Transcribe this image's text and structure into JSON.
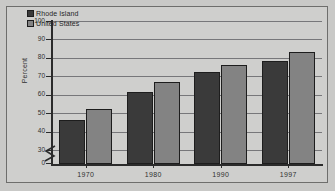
{
  "figure": {
    "top_caption_fragment": "",
    "background_color": "#cfcfcd",
    "frame_color": "#6e6e6c"
  },
  "legend": {
    "position": "top-left-inside",
    "entries": [
      {
        "label": "Rhode Island",
        "color": "#3a3a3a",
        "swatch_name": "legend-swatch-rhode-island"
      },
      {
        "label": "United States",
        "color": "#838383",
        "swatch_name": "legend-swatch-united-states"
      }
    ]
  },
  "axes": {
    "y_title": "Percent",
    "y_ticks": [
      "100",
      "90",
      "80",
      "70",
      "60",
      "50",
      "40",
      "30",
      "0"
    ],
    "y_break": true,
    "x_ticks": [
      "1970",
      "1980",
      "1990",
      "1997"
    ]
  },
  "chart_data": {
    "type": "bar",
    "title": "",
    "subtitle": "",
    "xlabel": "",
    "ylabel": "Percent",
    "categories": [
      "1970",
      "1980",
      "1990",
      "1997"
    ],
    "series": [
      {
        "name": "Rhode Island",
        "color": "#3a3a3a",
        "values": [
          46.5,
          61.5,
          72.5,
          78.5
        ]
      },
      {
        "name": "United States",
        "color": "#838383",
        "values": [
          52.5,
          67.0,
          76.0,
          83.0
        ]
      }
    ],
    "ylim": [
      30,
      100
    ],
    "y_axis_break_below": 30,
    "y_tick_step": 10,
    "grid": true,
    "legend_position": "top-left-inside",
    "annotations": []
  }
}
